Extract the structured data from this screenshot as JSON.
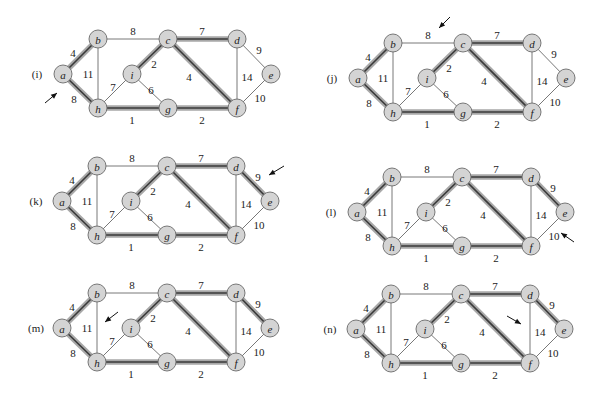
{
  "figure": {
    "nodes": [
      {
        "id": "a",
        "label": "a",
        "dx": 0,
        "dy": 0
      },
      {
        "id": "b",
        "label": "b",
        "dx": 35,
        "dy": -35
      },
      {
        "id": "c",
        "label": "c",
        "dx": 105,
        "dy": -35
      },
      {
        "id": "d",
        "label": "d",
        "dx": 174,
        "dy": -35
      },
      {
        "id": "e",
        "label": "e",
        "dx": 208,
        "dy": 0
      },
      {
        "id": "f",
        "label": "f",
        "dx": 174,
        "dy": 34
      },
      {
        "id": "g",
        "label": "g",
        "dx": 105,
        "dy": 34
      },
      {
        "id": "h",
        "label": "h",
        "dx": 35,
        "dy": 34
      },
      {
        "id": "i",
        "label": "i",
        "dx": 69,
        "dy": 0
      }
    ],
    "edges": [
      {
        "id": "ab",
        "from": "a",
        "to": "b",
        "weight": "4",
        "lx": 10,
        "ly": -21
      },
      {
        "id": "ah",
        "from": "a",
        "to": "h",
        "weight": "8",
        "lx": 11,
        "ly": 25
      },
      {
        "id": "bc",
        "from": "b",
        "to": "c",
        "weight": "8",
        "lx": 70,
        "ly": -43
      },
      {
        "id": "bh",
        "from": "b",
        "to": "h",
        "weight": "11",
        "lx": 25,
        "ly": 0
      },
      {
        "id": "ci",
        "from": "c",
        "to": "i",
        "weight": "2",
        "lx": 91,
        "ly": -10
      },
      {
        "id": "cd",
        "from": "c",
        "to": "d",
        "weight": "7",
        "lx": 139,
        "ly": -43
      },
      {
        "id": "cf",
        "from": "c",
        "to": "f",
        "weight": "4",
        "lx": 126,
        "ly": 3
      },
      {
        "id": "de",
        "from": "d",
        "to": "e",
        "weight": "9",
        "lx": 196,
        "ly": -24
      },
      {
        "id": "df",
        "from": "d",
        "to": "f",
        "weight": "14",
        "lx": 184,
        "ly": 3
      },
      {
        "id": "ef",
        "from": "e",
        "to": "f",
        "weight": "10",
        "lx": 197,
        "ly": 24
      },
      {
        "id": "hi",
        "from": "h",
        "to": "i",
        "weight": "7",
        "lx": 50,
        "ly": 13
      },
      {
        "id": "ig",
        "from": "i",
        "to": "g",
        "weight": "6",
        "lx": 88,
        "ly": 16
      },
      {
        "id": "hg",
        "from": "h",
        "to": "g",
        "weight": "1",
        "lx": 69,
        "ly": 46
      },
      {
        "id": "gf",
        "from": "g",
        "to": "f",
        "weight": "2",
        "lx": 139,
        "ly": 46
      }
    ],
    "panels": [
      {
        "label": "(i)",
        "origin": [
          63,
          74
        ],
        "highlighted": [
          "ab",
          "ah",
          "ci",
          "cd",
          "cf",
          "hg",
          "gf"
        ],
        "arrow": {
          "from": [
            -18,
            29
          ],
          "to": [
            -6,
            19
          ]
        }
      },
      {
        "label": "(j)",
        "origin": [
          358,
          78
        ],
        "highlighted": [
          "ab",
          "ah",
          "ci",
          "cd",
          "cf",
          "hg",
          "gf"
        ],
        "arrow": {
          "from": [
            92,
            -61
          ],
          "to": [
            81,
            -50
          ]
        }
      },
      {
        "label": "(k)",
        "origin": [
          62,
          201
        ],
        "highlighted": [
          "ab",
          "ah",
          "ci",
          "cd",
          "cf",
          "hg",
          "gf",
          "de"
        ],
        "arrow": {
          "from": [
            222,
            -35
          ],
          "to": [
            207,
            -26
          ]
        }
      },
      {
        "label": "(l)",
        "origin": [
          357,
          212
        ],
        "highlighted": [
          "ab",
          "ah",
          "ci",
          "cd",
          "cf",
          "hg",
          "gf",
          "de"
        ],
        "arrow": {
          "from": [
            217,
            30
          ],
          "to": [
            204,
            21
          ]
        }
      },
      {
        "label": "(m)",
        "origin": [
          62,
          328
        ],
        "highlighted": [
          "ab",
          "ah",
          "ci",
          "cd",
          "cf",
          "hg",
          "gf",
          "de"
        ],
        "arrow": {
          "from": [
            56,
            -16
          ],
          "to": [
            43,
            -6
          ]
        }
      },
      {
        "label": "(n)",
        "origin": [
          356,
          329
        ],
        "highlighted": [
          "ab",
          "ah",
          "ci",
          "cd",
          "cf",
          "hg",
          "gf",
          "de"
        ],
        "arrow": {
          "from": [
            151,
            -13
          ],
          "to": [
            165,
            -5
          ]
        }
      }
    ],
    "colors": {
      "node_fill": "#d4d4d4",
      "node_stroke": "#6a6a6a",
      "edge_thin": "#555555",
      "edge_highlight_outer": "#a8a8a8",
      "edge_highlight_inner": "#3a3a3a",
      "text": "#222222"
    },
    "node_radius": 9
  }
}
